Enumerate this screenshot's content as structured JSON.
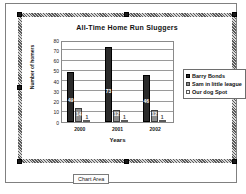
{
  "app": {
    "selection_label": "Chart Area"
  },
  "chart_data": {
    "type": "bar",
    "title": "All-Time Home Run Sluggers",
    "xlabel": "Years",
    "ylabel": "Number of homers",
    "categories": [
      "2000",
      "2001",
      "2002"
    ],
    "ylim": [
      0,
      80
    ],
    "ytick_step": 10,
    "yticks": [
      "0",
      "10",
      "20",
      "30",
      "40",
      "50",
      "60",
      "70",
      "80"
    ],
    "grid": true,
    "legend_position": "right",
    "series": [
      {
        "name": "Barry Bonds",
        "color": "#2b2b2b",
        "values": [
          49,
          73,
          46
        ],
        "labels": [
          "49",
          "73",
          "46"
        ]
      },
      {
        "name": "Sam in little league",
        "color": "#8d8d8d",
        "values": [
          14,
          12,
          12
        ],
        "labels": [
          "14",
          "12",
          "12"
        ]
      },
      {
        "name": "Our dog Spot",
        "color": "#eeeeee",
        "values": [
          1,
          1,
          1
        ],
        "labels": [
          "1",
          "1",
          "1"
        ]
      }
    ]
  }
}
